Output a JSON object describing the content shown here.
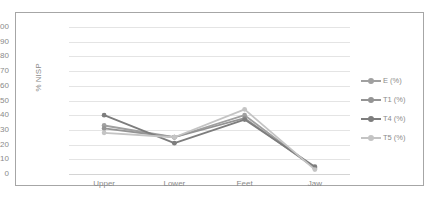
{
  "chart_data": {
    "type": "line",
    "title": "",
    "xlabel": "",
    "ylabel": "% NISP",
    "categories": [
      "Upper",
      "Lower",
      "Feet",
      "Jaw"
    ],
    "ylim": [
      0,
      100
    ],
    "yticks": [
      100,
      90,
      80,
      70,
      60,
      50,
      40,
      30,
      20,
      10,
      0
    ],
    "grid": true,
    "legend_position": "right",
    "series": [
      {
        "name": "E (%)",
        "values": [
          33,
          25,
          40,
          4
        ],
        "color": "#a0a0a0"
      },
      {
        "name": "T1 (%)",
        "values": [
          31,
          25,
          38,
          4
        ],
        "color": "#949494"
      },
      {
        "name": "T4 (%)",
        "values": [
          40,
          21,
          37,
          5
        ],
        "color": "#7d7d7d"
      },
      {
        "name": "T5 (%)",
        "values": [
          28,
          25,
          44,
          3
        ],
        "color": "#c4c4c4"
      }
    ]
  },
  "style": {
    "border_color": "#a6a6a6",
    "grid_color": "#e4e4e4",
    "tick_text_color": "#8a8a8a",
    "plot_background": "#ffffff"
  }
}
